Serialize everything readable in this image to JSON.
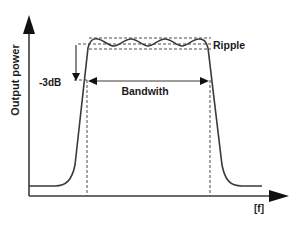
{
  "diagram": {
    "type": "bandpass-filter-response",
    "y_axis_label": "Output power",
    "x_axis_label": "[f]",
    "annotations": {
      "ripple": "Ripple",
      "minus3db": "-3dB",
      "bandwidth": "Bandwith"
    },
    "colors": {
      "line": "#3a3a3a",
      "dashed": "#4a4a4a",
      "text": "#1a1a1a",
      "background": "#ffffff"
    }
  }
}
